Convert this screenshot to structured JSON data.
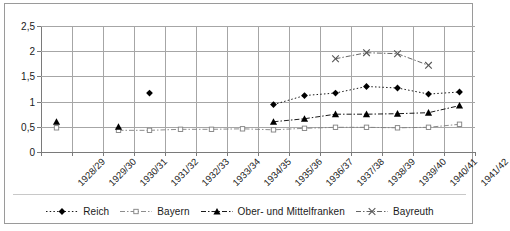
{
  "chart_data": {
    "type": "line",
    "title": "",
    "subtitle": "",
    "xlabel": "",
    "ylabel": "",
    "ylim": [
      0,
      2.5
    ],
    "ytick_labels": [
      "0",
      "0,5",
      "1",
      "1,5",
      "2",
      "2,5"
    ],
    "ytick_values": [
      0,
      0.5,
      1,
      1.5,
      2,
      2.5
    ],
    "grid": true,
    "grid_axes": "both",
    "legend_position": "bottom",
    "categories": [
      "1928/29",
      "1929/30",
      "1930/31",
      "1931/32",
      "1932/33",
      "1933/34",
      "1934/35",
      "1935/36",
      "1936/37",
      "1937/38",
      "1938/39",
      "1939/40",
      "1940/41",
      "1941/42"
    ],
    "series": [
      {
        "name": "Reich",
        "marker": "filled-diamond",
        "line_style": "dotted",
        "color": "#000000",
        "values": [
          null,
          null,
          null,
          1.17,
          null,
          null,
          null,
          0.94,
          1.12,
          1.17,
          1.3,
          1.27,
          1.15,
          1.19
        ]
      },
      {
        "name": "Bayern",
        "marker": "open-square",
        "line_style": "dash-dot",
        "color": "#808080",
        "values": [
          0.48,
          null,
          0.43,
          0.43,
          0.45,
          0.45,
          0.46,
          0.44,
          0.47,
          0.49,
          0.49,
          0.48,
          0.49,
          0.55
        ]
      },
      {
        "name": "Ober- und Mittelfranken",
        "marker": "filled-triangle",
        "line_style": "dash-dot",
        "color": "#000000",
        "values": [
          0.6,
          null,
          0.5,
          null,
          null,
          null,
          null,
          0.6,
          0.66,
          0.75,
          0.75,
          0.76,
          0.78,
          0.92
        ]
      },
      {
        "name": "Bayreuth",
        "marker": "x-cross",
        "line_style": "dash-dot",
        "color": "#555555",
        "values": [
          null,
          null,
          null,
          null,
          null,
          null,
          null,
          null,
          null,
          1.85,
          1.97,
          1.95,
          1.72,
          null
        ]
      }
    ]
  },
  "legend": {
    "items": [
      {
        "label": "Reich",
        "marker": "filled-diamond"
      },
      {
        "label": "Bayern",
        "marker": "open-square"
      },
      {
        "label": "Ober- und Mittelfranken",
        "marker": "filled-triangle"
      },
      {
        "label": "Bayreuth",
        "marker": "x-cross"
      }
    ]
  }
}
